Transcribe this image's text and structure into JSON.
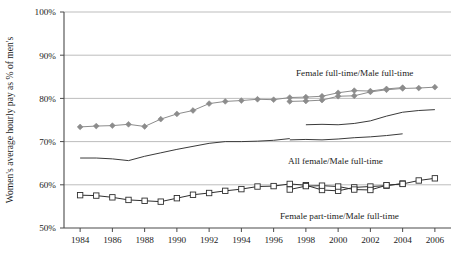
{
  "chart_data": {
    "type": "line",
    "title": "",
    "xlabel": "",
    "ylabel": "Women's average hourly pay as % of men's",
    "ylim": [
      50,
      100
    ],
    "xlim": [
      1983,
      2007
    ],
    "grid": true,
    "legend_position": "inline-annotations",
    "y_ticks": [
      "50%",
      "60%",
      "70%",
      "80%",
      "90%",
      "100%"
    ],
    "y_tick_values": [
      50,
      60,
      70,
      80,
      90,
      100
    ],
    "x_ticks": [
      "1984",
      "1986",
      "1988",
      "1990",
      "1992",
      "1994",
      "1996",
      "1998",
      "2000",
      "2002",
      "2004",
      "2006"
    ],
    "x_tick_values": [
      1984,
      1986,
      1988,
      1990,
      1992,
      1994,
      1996,
      1998,
      2000,
      2002,
      2004,
      2006
    ],
    "series": [
      {
        "name": "Female full-time/Male full-time",
        "marker": "diamond",
        "color": "#8c8c8c",
        "x": [
          1984,
          1985,
          1986,
          1987,
          1988,
          1989,
          1990,
          1991,
          1992,
          1993,
          1994,
          1995,
          1996,
          1997,
          1998,
          1999,
          2000,
          2001,
          2002,
          2003,
          2004
        ],
        "values": [
          73.4,
          73.6,
          73.7,
          74.0,
          73.5,
          75.2,
          76.4,
          77.2,
          78.8,
          79.3,
          79.5,
          79.8,
          79.7,
          80.2,
          80.3,
          80.5,
          81.3,
          81.8,
          81.7,
          82.2,
          82.5
        ]
      },
      {
        "name": "Female full-time/Male full-time (revised)",
        "marker": "diamond",
        "color": "#8c8c8c",
        "x": [
          1997,
          1998,
          1999,
          2000,
          2001,
          2002,
          2003,
          2004,
          2005,
          2006
        ],
        "values": [
          79.3,
          79.4,
          79.6,
          80.5,
          80.6,
          81.5,
          82.0,
          82.3,
          82.4,
          82.6
        ]
      },
      {
        "name": "All female/Male full-time",
        "marker": "none",
        "color": "#3a3a3a",
        "x": [
          1984,
          1985,
          1986,
          1987,
          1988,
          1989,
          1990,
          1991,
          1992,
          1993,
          1994,
          1995,
          1996,
          1997
        ],
        "values": [
          66.2,
          66.2,
          66.0,
          65.6,
          66.6,
          67.4,
          68.2,
          68.9,
          69.6,
          70.0,
          70.0,
          70.1,
          70.3,
          70.7
        ]
      },
      {
        "name": "All female/Male full-time (revised a)",
        "marker": "none",
        "color": "#3a3a3a",
        "x": [
          1997,
          1998,
          1999,
          2000,
          2001,
          2002,
          2003,
          2004
        ],
        "values": [
          70.4,
          70.5,
          70.4,
          70.6,
          70.9,
          71.1,
          71.4,
          71.8
        ]
      },
      {
        "name": "All female/Male full-time (revised b)",
        "marker": "none",
        "color": "#3a3a3a",
        "x": [
          1998,
          1999,
          2000,
          2001,
          2002,
          2003,
          2004,
          2005,
          2006
        ],
        "values": [
          73.9,
          74.0,
          73.9,
          74.2,
          74.8,
          75.9,
          76.8,
          77.2,
          77.4
        ]
      },
      {
        "name": "Female part-time/Male full-time",
        "marker": "square",
        "color": "#2f2f2f",
        "x": [
          1984,
          1985,
          1986,
          1987,
          1988,
          1989,
          1990,
          1991,
          1992,
          1993,
          1994,
          1995,
          1996,
          1997,
          1998,
          1999,
          2000,
          2001,
          2002,
          2003,
          2004
        ],
        "values": [
          57.6,
          57.5,
          57.1,
          56.5,
          56.3,
          56.1,
          56.9,
          57.7,
          58.1,
          58.6,
          59.0,
          59.6,
          59.7,
          60.2,
          59.9,
          58.8,
          58.6,
          59.4,
          59.6,
          59.8,
          60.3
        ]
      },
      {
        "name": "Female part-time/Male full-time (revised)",
        "marker": "square",
        "color": "#2f2f2f",
        "x": [
          1997,
          1998,
          1999,
          2000,
          2001,
          2002,
          2003,
          2004,
          2005,
          2006
        ],
        "values": [
          58.9,
          59.7,
          59.8,
          59.6,
          58.9,
          58.8,
          59.9,
          60.2,
          61.0,
          61.5
        ]
      }
    ],
    "annotations": [
      {
        "text": "Female full-time/Male full-time",
        "x": 296,
        "y": 76
      },
      {
        "text": "All female/Male full-time",
        "x": 288,
        "y": 164
      },
      {
        "text": "Female part-time/Male full-time",
        "x": 280,
        "y": 219
      }
    ]
  }
}
